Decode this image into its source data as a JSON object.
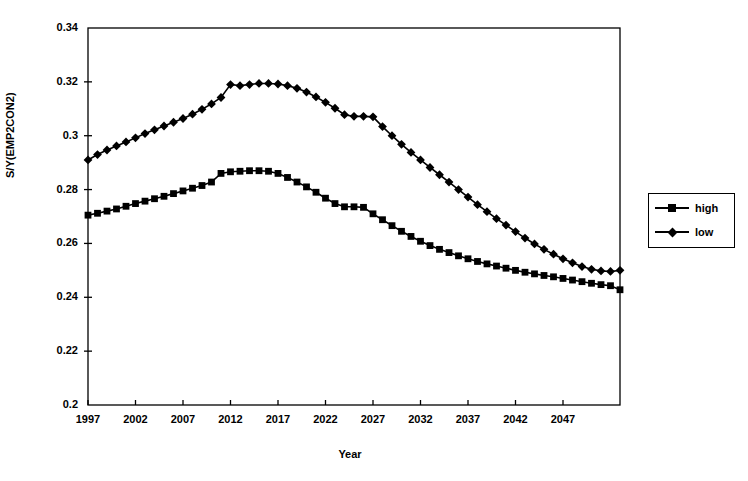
{
  "chart_data": {
    "type": "line",
    "title": "",
    "xlabel": "Year",
    "ylabel": "S/Y(EMP2CON2)",
    "xlim": [
      1997,
      2053
    ],
    "ylim": [
      0.2,
      0.34
    ],
    "grid": false,
    "legend_position": "right-outside",
    "x_ticks": [
      "1997",
      "2002",
      "2007",
      "2012",
      "2017",
      "2022",
      "2027",
      "2032",
      "2037",
      "2042",
      "2047"
    ],
    "x_tick_values": [
      1997,
      2002,
      2007,
      2012,
      2017,
      2022,
      2027,
      2032,
      2037,
      2042,
      2047
    ],
    "y_ticks": [
      "0.2",
      "0.22",
      "0.24",
      "0.26",
      "0.28",
      "0.3",
      "0.32",
      "0.34"
    ],
    "y_tick_values": [
      0.2,
      0.22,
      0.24,
      0.26,
      0.28,
      0.3,
      0.32,
      0.34
    ],
    "x": [
      1997,
      1998,
      1999,
      2000,
      2001,
      2002,
      2003,
      2004,
      2005,
      2006,
      2007,
      2008,
      2009,
      2010,
      2011,
      2012,
      2013,
      2014,
      2015,
      2016,
      2017,
      2018,
      2019,
      2020,
      2021,
      2022,
      2023,
      2024,
      2025,
      2026,
      2027,
      2028,
      2029,
      2030,
      2031,
      2032,
      2033,
      2034,
      2035,
      2036,
      2037,
      2038,
      2039,
      2040,
      2041,
      2042,
      2043,
      2044,
      2045,
      2046,
      2047,
      2048,
      2049,
      2050,
      2051,
      2052,
      2053
    ],
    "series": [
      {
        "name": "high",
        "marker": "square",
        "color": "#000000",
        "values": [
          0.2705,
          0.2712,
          0.272,
          0.2728,
          0.2738,
          0.2748,
          0.2757,
          0.2766,
          0.2775,
          0.2785,
          0.2795,
          0.2805,
          0.2815,
          0.2828,
          0.286,
          0.2866,
          0.2868,
          0.287,
          0.287,
          0.2868,
          0.286,
          0.2845,
          0.2828,
          0.281,
          0.279,
          0.2768,
          0.2748,
          0.2736,
          0.2736,
          0.2734,
          0.271,
          0.2688,
          0.2666,
          0.2645,
          0.2626,
          0.2608,
          0.2592,
          0.2578,
          0.2566,
          0.2554,
          0.2543,
          0.2533,
          0.2524,
          0.2516,
          0.2508,
          0.25,
          0.2493,
          0.2487,
          0.2481,
          0.2476,
          0.247,
          0.2464,
          0.2458,
          0.2452,
          0.2447,
          0.2443,
          0.2428
        ],
        "peak_value": 0.287,
        "peak_year": 2014,
        "start_value": 0.2705,
        "end_value": 0.2428
      },
      {
        "name": "low",
        "marker": "diamond",
        "color": "#000000",
        "values": [
          0.291,
          0.293,
          0.2947,
          0.2962,
          0.2977,
          0.2992,
          0.3008,
          0.3022,
          0.3036,
          0.305,
          0.3064,
          0.308,
          0.3098,
          0.3118,
          0.3142,
          0.319,
          0.3186,
          0.319,
          0.3194,
          0.3194,
          0.3192,
          0.3186,
          0.3176,
          0.3162,
          0.3144,
          0.3124,
          0.3102,
          0.3078,
          0.3072,
          0.3072,
          0.307,
          0.3034,
          0.3,
          0.2968,
          0.2938,
          0.291,
          0.2882,
          0.2855,
          0.2828,
          0.28,
          0.2772,
          0.2744,
          0.2718,
          0.2692,
          0.2668,
          0.2644,
          0.262,
          0.2598,
          0.2578,
          0.256,
          0.2543,
          0.2528,
          0.2514,
          0.2504,
          0.2498,
          0.2496,
          0.25
        ],
        "peak_value": 0.3194,
        "peak_year": 2015,
        "start_value": 0.291,
        "end_value": 0.25
      }
    ],
    "legend": [
      {
        "label": "high",
        "marker": "square"
      },
      {
        "label": "low",
        "marker": "diamond"
      }
    ]
  }
}
